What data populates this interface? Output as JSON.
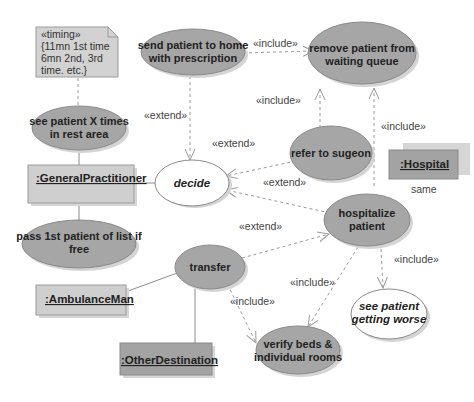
{
  "note": {
    "lines": [
      "«timing»",
      "{11mn 1st time",
      "6mn 2nd, 3rd",
      "time. etc.}"
    ]
  },
  "use_cases": {
    "see_patient": [
      "see patient X times",
      "in rest area"
    ],
    "send_home": [
      "send patient to home",
      "with prescription"
    ],
    "remove_patient": [
      "remove patient from",
      "waiting queue"
    ],
    "refer_surgeon": [
      "refer to sugeon"
    ],
    "decide": [
      "decide"
    ],
    "pass_first": [
      "pass 1st patient of list if",
      "free"
    ],
    "hospitalize": [
      "hospitalize",
      "patient"
    ],
    "transfer": [
      "transfer"
    ],
    "verify_beds": [
      "verify beds &",
      "individual rooms"
    ],
    "getting_worse": [
      "see patient",
      "getting worse"
    ]
  },
  "actors": {
    "general_practitioner": ":GeneralPractitioner",
    "hospital": ":Hospital",
    "ambulance_man": ":AmbulanceMan",
    "other_destination": ":OtherDestination"
  },
  "relations": {
    "send_home_to_remove": "«include»",
    "refer_to_remove": "«include»",
    "hospitalize_to_remove": "«include»",
    "send_home_to_decide": "«extend»",
    "refer_to_decide": "«extend»",
    "hospitalize_to_decide": "«extend»",
    "transfer_to_hospitalize": "«extend»",
    "hospitalize_to_verify": "«include»",
    "transfer_to_verify": "«include»",
    "hospitalize_to_worse": "«include»",
    "hospital_assoc_label": "same"
  },
  "colors": {
    "use_case_fill": "#a6a6a6",
    "actor_fill": "#cfcfcf",
    "actor_dark_fill": "#a3a3a3",
    "note_fill": "#d2d2d2",
    "background": "#ffffff"
  }
}
